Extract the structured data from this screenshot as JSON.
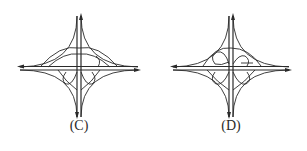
{
  "figures": [
    {
      "id": "C",
      "caption": "(C)",
      "type": "interchange-diagram",
      "loops": 2,
      "description": "Interchange with upper arc ramps and two loop ramps below main crossing"
    },
    {
      "id": "D",
      "caption": "(D)",
      "type": "interchange-diagram",
      "loops": 4,
      "description": "Interchange with loop ramps in quadrants above and below main crossing"
    }
  ],
  "colors": {
    "line": "#2a2a2a",
    "background": "#ffffff"
  }
}
